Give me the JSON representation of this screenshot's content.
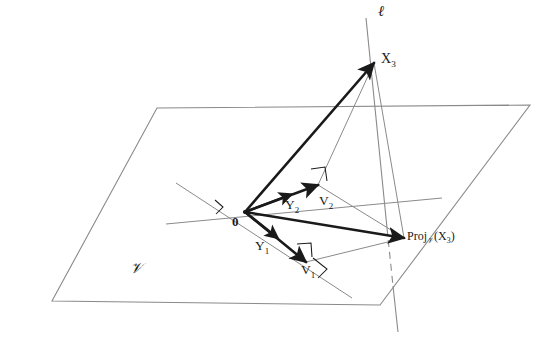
{
  "figure": {
    "type": "geometric-diagram",
    "background_color": "#ffffff",
    "stroke_colors": {
      "bold_vector": "#1a1a1a",
      "thin_line": "#808080",
      "plane_edge": "#8a8a8a",
      "label_text": "#1a1a1a"
    }
  },
  "labels": {
    "line_l": "ℓ",
    "point_x3": "X",
    "point_x3_sub": "3",
    "origin": "0",
    "y1": "Y",
    "y1_sub": "1",
    "y2": "Y",
    "y2_sub": "2",
    "v1": "V",
    "v1_sub": "1",
    "v2": "V",
    "v2_sub": "2",
    "plane_v": "𝒱",
    "proj_prefix": "Proj",
    "proj_sub": "𝒱",
    "proj_open": "(X",
    "proj_arg_sub": "3",
    "proj_close": ")"
  },
  "geometry": {
    "plane_corners": [
      [
        157,
        108
      ],
      [
        530,
        105
      ],
      [
        380,
        305
      ],
      [
        52,
        301
      ]
    ],
    "origin_point": [
      245,
      212
    ],
    "x3_point": [
      374,
      63
    ],
    "proj_point": [
      404,
      238
    ],
    "v1_point": [
      306,
      262
    ],
    "v2_point": [
      318,
      185
    ],
    "line_l_top": [
      366,
      18
    ],
    "line_l_bottom": [
      398,
      330
    ],
    "axis1_start": [
      176,
      183
    ],
    "axis1_end": [
      352,
      298
    ],
    "axis2_start": [
      166,
      224
    ],
    "axis2_end": [
      442,
      198
    ]
  },
  "vectors": [
    {
      "name": "origin-to-x3",
      "from": "origin",
      "to": "x3",
      "style": "bold-arrow"
    },
    {
      "name": "origin-to-y2-v2",
      "from": "origin",
      "to": "v2",
      "style": "bold-arrow"
    },
    {
      "name": "origin-to-y1-v1",
      "from": "origin",
      "to": "v1",
      "style": "bold-arrow"
    },
    {
      "name": "origin-to-proj",
      "from": "origin",
      "to": "proj",
      "style": "bold-arrow"
    },
    {
      "name": "x3-to-proj",
      "from": "x3",
      "to": "proj",
      "style": "thin-line"
    },
    {
      "name": "x3-to-v2",
      "from": "x3",
      "to": "v2",
      "style": "thin-line"
    },
    {
      "name": "v2-to-proj",
      "from": "v2",
      "to": "proj",
      "style": "thin-line"
    },
    {
      "name": "v1-to-proj",
      "from": "v1",
      "to": "proj",
      "style": "thin-line"
    }
  ]
}
